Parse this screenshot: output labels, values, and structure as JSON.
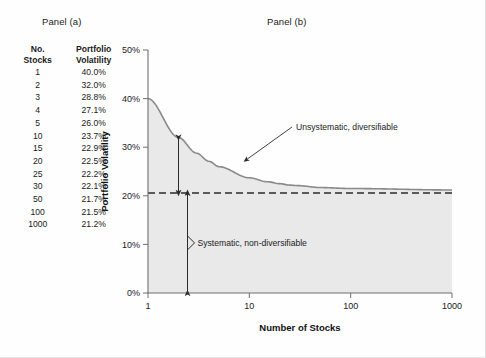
{
  "panels": {
    "a_title": "Panel (a)",
    "b_title": "Panel (b)"
  },
  "table": {
    "header": {
      "col0_line1": "No.",
      "col0_line2": "Stocks",
      "col1_line1": "Portfolio",
      "col1_line2": "Volatility"
    },
    "rows": [
      {
        "stocks": "1",
        "volatility": "40.0%"
      },
      {
        "stocks": "2",
        "volatility": "32.0%"
      },
      {
        "stocks": "3",
        "volatility": "28.8%"
      },
      {
        "stocks": "4",
        "volatility": "27.1%"
      },
      {
        "stocks": "5",
        "volatility": "26.0%"
      },
      {
        "stocks": "10",
        "volatility": "23.7%"
      },
      {
        "stocks": "15",
        "volatility": "22.9%"
      },
      {
        "stocks": "20",
        "volatility": "22.5%"
      },
      {
        "stocks": "25",
        "volatility": "22.2%"
      },
      {
        "stocks": "30",
        "volatility": "22.1%"
      },
      {
        "stocks": "50",
        "volatility": "21.7%"
      },
      {
        "stocks": "100",
        "volatility": "21.5%"
      },
      {
        "stocks": "1000",
        "volatility": "21.2%"
      }
    ]
  },
  "chart_data": {
    "type": "line",
    "title": "",
    "xlabel": "Number of Stocks",
    "ylabel": "Portfolio Volatility",
    "xscale": "log",
    "xlim": [
      1,
      1000
    ],
    "ylim": [
      0,
      50
    ],
    "xticks": [
      "1",
      "10",
      "100",
      "1000"
    ],
    "xtick_values": [
      1,
      10,
      100,
      1000
    ],
    "yticks": [
      "0%",
      "10%",
      "20%",
      "30%",
      "40%",
      "50%"
    ],
    "ytick_values": [
      0,
      10,
      20,
      30,
      40,
      50
    ],
    "grid": false,
    "legend": null,
    "x": [
      1,
      2,
      3,
      4,
      5,
      10,
      15,
      20,
      25,
      30,
      50,
      100,
      1000
    ],
    "y": [
      40.0,
      32.0,
      28.8,
      27.1,
      26.0,
      23.7,
      22.9,
      22.5,
      22.2,
      22.1,
      21.7,
      21.5,
      21.2
    ],
    "series": [
      {
        "name": "Portfolio Volatility",
        "values": [
          40.0,
          32.0,
          28.8,
          27.1,
          26.0,
          23.7,
          22.9,
          22.5,
          22.2,
          22.1,
          21.7,
          21.5,
          21.2
        ]
      }
    ],
    "area_fill": true,
    "reference_line": {
      "value": 20.6,
      "style": "dashed",
      "label": "systematic risk level"
    },
    "annotations": [
      {
        "text": "Unsystematic, diversifiable",
        "at_x": 2,
        "spans_y": [
          20.6,
          32.0
        ]
      },
      {
        "text": "Systematic, non-diversifiable",
        "at_x": 2,
        "spans_y": [
          0,
          20.6
        ]
      }
    ],
    "colors": {
      "curve": "#8a8a8a",
      "area": "#e9e9e9",
      "reference_line": "#2b2b2b",
      "axis": "#6f6f6f"
    }
  }
}
